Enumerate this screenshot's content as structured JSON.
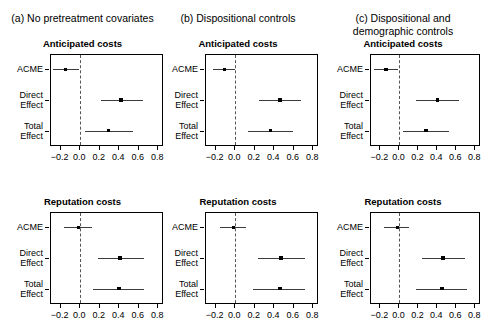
{
  "figure": {
    "width": 483,
    "height": 333,
    "background": "#ffffff",
    "line_color": "#3b3b3b",
    "point_color": "#000000",
    "zero_line_color": "#555555"
  },
  "panels": [
    {
      "id": "a",
      "caption": "(a) No pretreatment covariates",
      "caption_lines": [
        "(a) No pretreatment covariates"
      ]
    },
    {
      "id": "b",
      "caption": "(b) Dispositional controls",
      "caption_lines": [
        "(b) Dispositional controls"
      ]
    },
    {
      "id": "c",
      "caption": "(c) Dispositional and demographic controls",
      "caption_lines": [
        "(c) Dispositional and",
        "demographic controls"
      ]
    }
  ],
  "rows": [
    {
      "id": "anticipated",
      "title": "Anticipated costs"
    },
    {
      "id": "reputation",
      "title": "Reputation costs"
    }
  ],
  "axis": {
    "y_categories": [
      "ACME",
      "Direct\nEffect",
      "Total\nEffect"
    ],
    "x_ticks": [
      -0.2,
      0.0,
      0.2,
      0.4,
      0.6,
      0.8
    ],
    "x_tick_labels": [
      "−0.2",
      "0.0",
      "0.2",
      "0.4",
      "0.6",
      "0.8"
    ],
    "x_min": -0.3,
    "x_max": 0.86,
    "zero_reference": 0.0,
    "zero_line_style": "dashed"
  },
  "chart_data": {
    "type": "scatter",
    "xlabel": "",
    "ylabel": "",
    "xlim": [
      -0.3,
      0.86
    ],
    "grid": false,
    "legend": "none",
    "orientation": "horizontal",
    "marker": "point with 95% confidence interval line",
    "categories": [
      "ACME",
      "Direct Effect",
      "Total Effect"
    ],
    "panels": [
      {
        "panel": "a",
        "panel_label": "(a) No pretreatment covariates",
        "row": "anticipated",
        "row_label": "Anticipated costs",
        "series": [
          {
            "name": "ACME",
            "estimate": -0.14,
            "ci_low": -0.27,
            "ci_high": 0.0
          },
          {
            "name": "Direct Effect",
            "estimate": 0.43,
            "ci_low": 0.22,
            "ci_high": 0.65
          },
          {
            "name": "Total Effect",
            "estimate": 0.3,
            "ci_low": 0.06,
            "ci_high": 0.55
          }
        ]
      },
      {
        "panel": "a",
        "panel_label": "(a) No pretreatment covariates",
        "row": "reputation",
        "row_label": "Reputation costs",
        "series": [
          {
            "name": "ACME",
            "estimate": -0.01,
            "ci_low": -0.16,
            "ci_high": 0.13
          },
          {
            "name": "Direct Effect",
            "estimate": 0.42,
            "ci_low": 0.19,
            "ci_high": 0.66
          },
          {
            "name": "Total Effect",
            "estimate": 0.41,
            "ci_low": 0.14,
            "ci_high": 0.67
          }
        ]
      },
      {
        "panel": "b",
        "panel_label": "(b) Dispositional controls",
        "row": "anticipated",
        "row_label": "Anticipated costs",
        "series": [
          {
            "name": "ACME",
            "estimate": -0.1,
            "ci_low": -0.22,
            "ci_high": 0.01
          },
          {
            "name": "Direct Effect",
            "estimate": 0.47,
            "ci_low": 0.25,
            "ci_high": 0.69
          },
          {
            "name": "Total Effect",
            "estimate": 0.37,
            "ci_low": 0.14,
            "ci_high": 0.6
          }
        ]
      },
      {
        "panel": "b",
        "panel_label": "(b) Dispositional controls",
        "row": "reputation",
        "row_label": "Reputation costs",
        "series": [
          {
            "name": "ACME",
            "estimate": -0.01,
            "ci_low": -0.15,
            "ci_high": 0.12
          },
          {
            "name": "Direct Effect",
            "estimate": 0.48,
            "ci_low": 0.24,
            "ci_high": 0.73
          },
          {
            "name": "Total Effect",
            "estimate": 0.47,
            "ci_low": 0.19,
            "ci_high": 0.73
          }
        ]
      },
      {
        "panel": "c",
        "panel_label": "(c) Dispositional and demographic controls",
        "row": "anticipated",
        "row_label": "Anticipated costs",
        "series": [
          {
            "name": "ACME",
            "estimate": -0.13,
            "ci_low": -0.26,
            "ci_high": 0.0
          },
          {
            "name": "Direct Effect",
            "estimate": 0.41,
            "ci_low": 0.18,
            "ci_high": 0.64
          },
          {
            "name": "Total Effect",
            "estimate": 0.29,
            "ci_low": 0.05,
            "ci_high": 0.53
          }
        ]
      },
      {
        "panel": "c",
        "panel_label": "(c) Dispositional and demographic controls",
        "row": "reputation",
        "row_label": "Reputation costs",
        "series": [
          {
            "name": "ACME",
            "estimate": -0.01,
            "ci_low": -0.15,
            "ci_high": 0.11
          },
          {
            "name": "Direct Effect",
            "estimate": 0.47,
            "ci_low": 0.25,
            "ci_high": 0.7
          },
          {
            "name": "Total Effect",
            "estimate": 0.46,
            "ci_low": 0.19,
            "ci_high": 0.72
          }
        ]
      }
    ]
  }
}
